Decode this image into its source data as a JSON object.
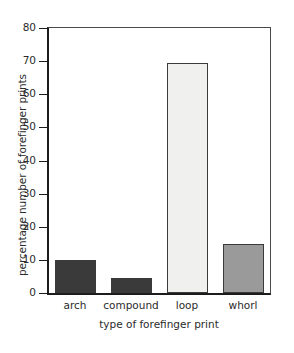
{
  "chart_data": {
    "type": "bar",
    "title": "",
    "xlabel": "type of forefinger print",
    "ylabel": "percentage number of forefinger prints",
    "categories": [
      "arch",
      "compound",
      "loop",
      "whorl"
    ],
    "values": [
      10,
      4.5,
      69.5,
      14.7
    ],
    "ylim": [
      0,
      80
    ],
    "yticks": [
      0,
      10,
      20,
      30,
      40,
      50,
      60,
      70,
      80
    ],
    "ytick_labels": [
      "0",
      "10",
      "20",
      "30",
      "40",
      "50",
      "60",
      "70",
      "80"
    ],
    "grid": false,
    "legend": null,
    "bar_colors": [
      "#3a3a3a",
      "#3a3a3a",
      "#f0f0ee",
      "#9a9a9a"
    ],
    "bar_edge_color": "#3a3a3a",
    "axis_color": "#1c1c1c",
    "frame_color": "#4a4a4a",
    "background": "#ffffff"
  }
}
